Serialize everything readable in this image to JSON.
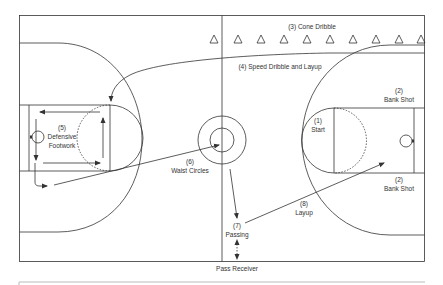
{
  "diagram": {
    "type": "basketball-court-drill-diagram",
    "stations": [
      {
        "number": "(1)",
        "name": "Start"
      },
      {
        "number": "(2)",
        "name": "Bank Shot",
        "position": "upper"
      },
      {
        "number": "(2)",
        "name": "Bank Shot",
        "position": "lower"
      },
      {
        "number": "(3)",
        "name": "Cone Dribble"
      },
      {
        "number": "(4)",
        "name": "Speed Dribble and Layup"
      },
      {
        "number": "(5)",
        "name": "Defensive Footwork"
      },
      {
        "number": "(6)",
        "name": "Waist Circles"
      },
      {
        "number": "(7)",
        "name": "Passing"
      },
      {
        "number": "(8)",
        "name": "Layup"
      }
    ],
    "outside_label": "Pass Receiver",
    "cone_count": 10
  },
  "labels": {
    "start_num": "(1)",
    "start": "Start",
    "bank_upper_num": "(2)",
    "bank_upper": "Bank Shot",
    "bank_lower_num": "(2)",
    "bank_lower": "Bank Shot",
    "cone_dribble": "(3) Cone Dribble",
    "speed_dribble": "(4) Speed Dribble and Layup",
    "defensive_num": "(5)",
    "defensive_1": "Defensive",
    "defensive_2": "Footwork",
    "waist_num": "(6)",
    "waist": "Waist Circles",
    "passing_num": "(7)",
    "passing": "Passing",
    "layup_num": "(8)",
    "layup": "Layup",
    "pass_receiver": "Pass Receiver"
  },
  "colors": {
    "line": "#333333",
    "text": "#333333",
    "background": "#ffffff"
  }
}
